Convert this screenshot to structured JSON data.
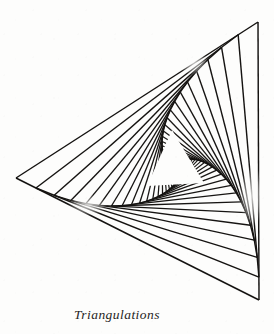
{
  "page": {
    "background_color": "#fdfdfc",
    "width": 274,
    "height": 334
  },
  "figure": {
    "name": "triangle-spiral-string-art",
    "ink_color": "#141210",
    "paper_color": "#fdfdfc",
    "outer_triangle": {
      "vertices": [
        {
          "label": "top-right",
          "x": 258,
          "y": 22
        },
        {
          "label": "left",
          "x": 16,
          "y": 178
        },
        {
          "label": "bottom-right",
          "x": 259,
          "y": 300
        }
      ]
    },
    "center_void_triangle": {
      "vertices": [
        {
          "label": "apex",
          "x": 172,
          "y": 130
        },
        {
          "label": "base-left",
          "x": 147,
          "y": 186
        },
        {
          "label": "base-right",
          "x": 204,
          "y": 183
        }
      ]
    },
    "iterations": 34,
    "step_ratio": 0.082,
    "stroke_width": 1.45,
    "fans": [
      {
        "name": "upper-fan",
        "orientation": "top-right to left",
        "line_count": 34
      },
      {
        "name": "right-fan",
        "orientation": "top-right to bottom-right",
        "line_count": 34
      },
      {
        "name": "lower-fan",
        "orientation": "left to bottom-right",
        "line_count": 34
      }
    ]
  },
  "caption": {
    "text": "Triangulations",
    "style": "italic-serif",
    "color": "#262423"
  }
}
